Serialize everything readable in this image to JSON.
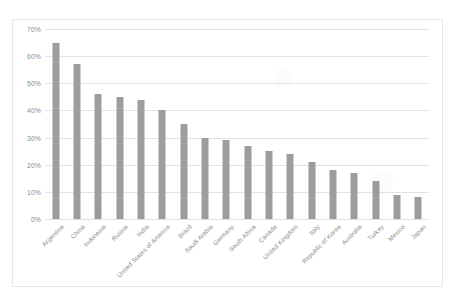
{
  "chart_data": {
    "type": "bar",
    "title": "",
    "subtitle": "",
    "xlabel": "",
    "ylabel": "",
    "ylim": [
      0,
      70
    ],
    "ytick_labels": [
      "0%",
      "10%",
      "20%",
      "30%",
      "40%",
      "50%",
      "60%",
      "70%"
    ],
    "ytick_values": [
      0,
      10,
      20,
      30,
      40,
      50,
      60,
      70
    ],
    "grid": true,
    "legend": false,
    "legend_position": "none",
    "bar_color": "#9d9d9d",
    "gridline_color": "#e2e2e2",
    "border_color": "#e8e8e8",
    "axis_text_color": "#8c8c8c",
    "categories": [
      "Argentina",
      "China",
      "Indonesia",
      "Russia",
      "India",
      "United States of America",
      "Brazil",
      "Saudi Arabia",
      "Germany",
      "South Africa",
      "Canada",
      "United Kingdom",
      "Italy",
      "Republic of Korea",
      "Australia",
      "Turkey",
      "Mexico",
      "Japan"
    ],
    "values": [
      65,
      57,
      46,
      45,
      44,
      40,
      35,
      30,
      29,
      27,
      25,
      24,
      21,
      18,
      17,
      14,
      9,
      8
    ]
  }
}
